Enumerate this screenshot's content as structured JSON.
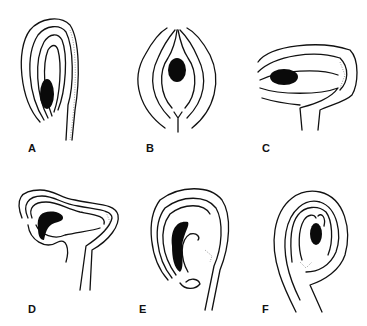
{
  "figure": {
    "panels": [
      {
        "id": "A",
        "label": "A",
        "label_pos": [
          28,
          142
        ]
      },
      {
        "id": "B",
        "label": "B",
        "label_pos": [
          146,
          142
        ]
      },
      {
        "id": "C",
        "label": "C",
        "label_pos": [
          262,
          142
        ]
      },
      {
        "id": "D",
        "label": "D",
        "label_pos": [
          28,
          303
        ]
      },
      {
        "id": "E",
        "label": "E",
        "label_pos": [
          139,
          303
        ]
      },
      {
        "id": "F",
        "label": "F",
        "label_pos": [
          262,
          303
        ]
      }
    ]
  }
}
